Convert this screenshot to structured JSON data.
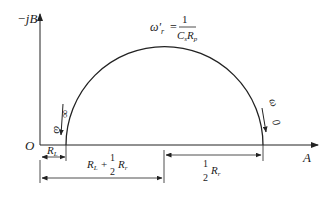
{
  "diagram": {
    "type": "admittance-circle",
    "axes": {
      "vertical_label": "−jB",
      "horizontal_label": "A",
      "origin_label": "O"
    },
    "resonance": {
      "lhs": "ω′",
      "lhs_sub": "r",
      "numerator": "1",
      "den_c": "C",
      "den_c_sub": "s",
      "den_r": "R",
      "den_r_sub": "p"
    },
    "frequency_markers": {
      "left": {
        "omega": "ω",
        "arrow_to": "∞"
      },
      "right": {
        "omega": "ω",
        "arrow_to": "0"
      }
    },
    "dimensions": {
      "rl": {
        "R": "R",
        "sub": "L"
      },
      "rl_plus_half_rr": {
        "R1": "R",
        "sub1": "L",
        "plus": "+",
        "num": "1",
        "den": "2",
        "R2": "R",
        "sub2": "r"
      },
      "half_rr": {
        "num": "1",
        "den": "2",
        "R": "R",
        "sub": "r"
      }
    },
    "colors": {
      "stroke": "#222222",
      "background": "#ffffff"
    }
  }
}
